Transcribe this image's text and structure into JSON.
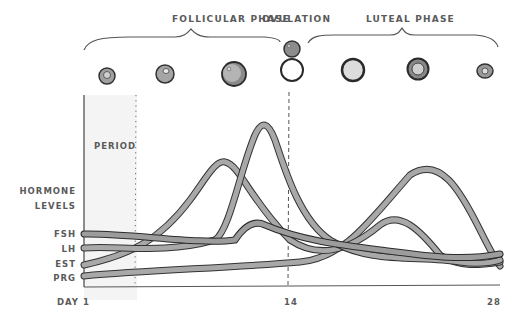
{
  "phases": {
    "follicular": "FOLLICULAR PHASE",
    "ovulation": "OVULATION",
    "luteal": "LUTEAL PHASE"
  },
  "period_label": "PERIOD",
  "y_axis": {
    "title_line1": "HORMONE",
    "title_line2": "LEVELS",
    "series_labels": [
      "FSH",
      "LH",
      "EST",
      "PRG"
    ]
  },
  "x_axis": {
    "ticks": [
      "DAY 1",
      "14",
      "28"
    ]
  },
  "follicle_stages": [
    "early follicle",
    "developing follicle",
    "mature follicle",
    "ovulating follicle with released egg",
    "corpus luteum",
    "corpus luteum regressing",
    "corpus albicans"
  ],
  "colors": {
    "curve_fill": "#9a9a9a",
    "curve_edge": "#3a3a3a",
    "text": "#5a5a5a",
    "period_shade": "#f2f2f2"
  }
}
